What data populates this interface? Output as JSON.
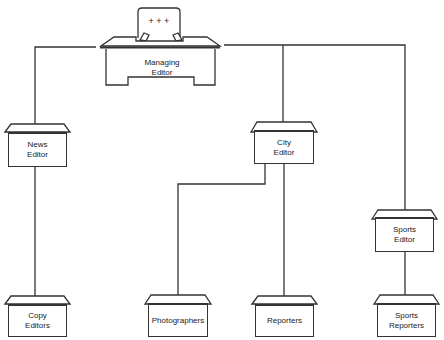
{
  "diagram": {
    "type": "organization-chart",
    "nodes": [
      {
        "id": "managing_editor",
        "label": "Managing\nEditor",
        "chair_marks": "+ + +"
      },
      {
        "id": "news_editor",
        "label": "News\nEditor"
      },
      {
        "id": "city_editor",
        "label": "City\nEditor"
      },
      {
        "id": "sports_editor",
        "label": "Sports\nEditor"
      },
      {
        "id": "copy_editors",
        "label": "Copy\nEditors"
      },
      {
        "id": "photographers",
        "label": "Photographers"
      },
      {
        "id": "reporters",
        "label": "Reporters"
      },
      {
        "id": "sports_reporters",
        "label": "Sports\nReporters"
      }
    ],
    "edges": [
      {
        "from": "managing_editor",
        "to": "news_editor"
      },
      {
        "from": "managing_editor",
        "to": "city_editor"
      },
      {
        "from": "managing_editor",
        "to": "sports_editor"
      },
      {
        "from": "news_editor",
        "to": "copy_editors"
      },
      {
        "from": "city_editor",
        "to": "photographers"
      },
      {
        "from": "city_editor",
        "to": "reporters"
      },
      {
        "from": "sports_editor",
        "to": "sports_reporters"
      }
    ],
    "colors": {
      "line": "#333333",
      "background": "#ffffff"
    }
  }
}
